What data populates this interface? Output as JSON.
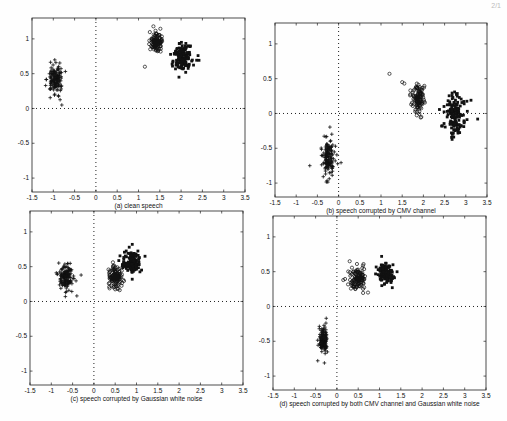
{
  "page": {
    "corner_mark": "2/1"
  },
  "chart_data": [
    {
      "id": "a",
      "type": "scatter",
      "title": "(a) clean speech",
      "xlabel": "",
      "ylabel": "",
      "xlim": [
        -1.5,
        3.5
      ],
      "ylim": [
        -1.2,
        1.3
      ],
      "xticks": [
        -1.5,
        -1,
        -0.5,
        0,
        0.5,
        1,
        1.5,
        2,
        2.5,
        3,
        3.5
      ],
      "xtick_labels": [
        "-1.5",
        "-1",
        "-0.5",
        "0",
        "0.5",
        "1",
        "1.5",
        "2",
        "2.5",
        "3",
        "3.5"
      ],
      "yticks": [
        -1,
        -0.5,
        0,
        0.5,
        1
      ],
      "ytick_labels": [
        "-1",
        "-0.5",
        "0",
        "0.5",
        "1"
      ],
      "grid": false,
      "zero_lines": "dotted",
      "box_px": {
        "left": 32,
        "top": 18,
        "width": 213,
        "height": 174
      },
      "series": [
        {
          "name": "class +",
          "marker": "plus",
          "n": 140,
          "cx": -0.95,
          "cy": 0.42,
          "sx": 0.09,
          "sy": 0.11
        },
        {
          "name": "class o",
          "marker": "circle",
          "n": 110,
          "cx": 1.42,
          "cy": 0.95,
          "sx": 0.07,
          "sy": 0.07
        },
        {
          "name": "class x",
          "marker": "square",
          "n": 150,
          "cx": 2.05,
          "cy": 0.74,
          "sx": 0.13,
          "sy": 0.1
        }
      ],
      "outliers": [
        {
          "marker": "circle",
          "x": 1.15,
          "y": 0.6
        },
        {
          "marker": "circle",
          "x": 1.35,
          "y": 1.18
        },
        {
          "marker": "square",
          "x": 1.95,
          "y": 0.45
        },
        {
          "marker": "plus",
          "x": -0.8,
          "y": 0.05
        }
      ]
    },
    {
      "id": "b",
      "type": "scatter",
      "title": "(b) speech corrupted by CMV channel",
      "xlabel": "",
      "ylabel": "",
      "xlim": [
        -1.5,
        3.5
      ],
      "ylim": [
        -1.2,
        1.3
      ],
      "xticks": [
        -1.5,
        -1,
        -0.5,
        0,
        0.5,
        1,
        1.5,
        2,
        2.5,
        3,
        3.5
      ],
      "xtick_labels": [
        "-1.5",
        "-1",
        "-0.5",
        "0",
        "0.5",
        "1",
        "1.5",
        "2",
        "2.5",
        "3",
        "3.5"
      ],
      "yticks": [
        -1,
        -0.5,
        0,
        0.5,
        1
      ],
      "ytick_labels": [
        "-1",
        "-0.5",
        "0",
        "0.5",
        "1"
      ],
      "grid": false,
      "zero_lines": "dotted",
      "box_px": {
        "left": 275,
        "top": 23,
        "width": 212,
        "height": 174
      },
      "series": [
        {
          "name": "class +",
          "marker": "plus",
          "n": 140,
          "cx": -0.25,
          "cy": -0.65,
          "sx": 0.08,
          "sy": 0.14
        },
        {
          "name": "class o",
          "marker": "circle",
          "n": 110,
          "cx": 1.88,
          "cy": 0.22,
          "sx": 0.07,
          "sy": 0.1
        },
        {
          "name": "class x",
          "marker": "square",
          "n": 150,
          "cx": 2.75,
          "cy": -0.05,
          "sx": 0.12,
          "sy": 0.15
        }
      ],
      "outliers": [
        {
          "marker": "circle",
          "x": 1.2,
          "y": 0.57
        },
        {
          "marker": "circle",
          "x": 1.5,
          "y": 0.45
        },
        {
          "marker": "circle",
          "x": 1.55,
          "y": 0.43
        },
        {
          "marker": "circle",
          "x": 1.95,
          "y": -0.05
        },
        {
          "marker": "square",
          "x": 3.28,
          "y": -0.08
        },
        {
          "marker": "plus",
          "x": -0.68,
          "y": -0.75
        }
      ]
    },
    {
      "id": "c",
      "type": "scatter",
      "title": "(c) speech corrupted by Gaussian white noise",
      "xlabel": "",
      "ylabel": "",
      "xlim": [
        -1.5,
        3.5
      ],
      "ylim": [
        -1.2,
        1.3
      ],
      "xticks": [
        -1.5,
        -1,
        -0.5,
        0,
        0.5,
        1,
        1.5,
        2,
        2.5,
        3,
        3.5
      ],
      "xtick_labels": [
        "-1.5",
        "-1",
        "-0.5",
        "0",
        "0.5",
        "1",
        "1.5",
        "2",
        "2.5",
        "3",
        "3.5"
      ],
      "yticks": [
        -1,
        -0.5,
        0,
        0.5,
        1
      ],
      "ytick_labels": [
        "-1",
        "-0.5",
        "0",
        "0.5",
        "1"
      ],
      "grid": false,
      "zero_lines": "dotted",
      "box_px": {
        "left": 30,
        "top": 211,
        "width": 213,
        "height": 174
      },
      "series": [
        {
          "name": "class +",
          "marker": "plus",
          "n": 140,
          "cx": -0.65,
          "cy": 0.35,
          "sx": 0.08,
          "sy": 0.09
        },
        {
          "name": "class o",
          "marker": "circle",
          "n": 120,
          "cx": 0.5,
          "cy": 0.37,
          "sx": 0.08,
          "sy": 0.08
        },
        {
          "name": "class x",
          "marker": "square",
          "n": 140,
          "cx": 0.88,
          "cy": 0.55,
          "sx": 0.1,
          "sy": 0.07
        }
      ],
      "outliers": [
        {
          "marker": "plus",
          "x": -0.3,
          "y": 0.38
        },
        {
          "marker": "plus",
          "x": -0.4,
          "y": 0.08
        },
        {
          "marker": "square",
          "x": 0.9,
          "y": 0.32
        },
        {
          "marker": "square",
          "x": 1.2,
          "y": 0.65
        }
      ]
    },
    {
      "id": "d",
      "type": "scatter",
      "title": "(d) speech corrupted by both CMV channel and Gaussian white noise",
      "xlabel": "",
      "ylabel": "",
      "xlim": [
        -1.5,
        3.5
      ],
      "ylim": [
        -1.2,
        1.3
      ],
      "xticks": [
        -1.5,
        -1,
        -0.5,
        0,
        0.5,
        1,
        1.5,
        2,
        2.5,
        3,
        3.5
      ],
      "xtick_labels": [
        "-1.5",
        "-1",
        "-0.5",
        "0",
        "0.5",
        "1",
        "1.5",
        "2",
        "2.5",
        "3",
        "3.5"
      ],
      "yticks": [
        -1,
        -0.5,
        0,
        0.5,
        1
      ],
      "ytick_labels": [
        "-1",
        "-0.5",
        "0",
        "0.5",
        "1"
      ],
      "grid": false,
      "zero_lines": "dotted",
      "box_px": {
        "left": 273,
        "top": 216,
        "width": 213,
        "height": 174
      },
      "series": [
        {
          "name": "class +",
          "marker": "plus",
          "n": 140,
          "cx": -0.32,
          "cy": -0.47,
          "sx": 0.05,
          "sy": 0.1
        },
        {
          "name": "class o",
          "marker": "circle",
          "n": 120,
          "cx": 0.5,
          "cy": 0.4,
          "sx": 0.09,
          "sy": 0.08
        },
        {
          "name": "class x",
          "marker": "square",
          "n": 130,
          "cx": 1.15,
          "cy": 0.48,
          "sx": 0.1,
          "sy": 0.07
        }
      ],
      "outliers": [
        {
          "marker": "plus",
          "x": -0.45,
          "y": -0.78
        },
        {
          "marker": "plus",
          "x": -0.25,
          "y": -0.17
        },
        {
          "marker": "circle",
          "x": 0.73,
          "y": 0.2
        },
        {
          "marker": "circle",
          "x": 0.3,
          "y": 0.65
        },
        {
          "marker": "circle",
          "x": 0.15,
          "y": 0.38
        },
        {
          "marker": "square",
          "x": 1.05,
          "y": 0.72
        },
        {
          "marker": "square",
          "x": 1.3,
          "y": 0.27
        }
      ]
    }
  ]
}
